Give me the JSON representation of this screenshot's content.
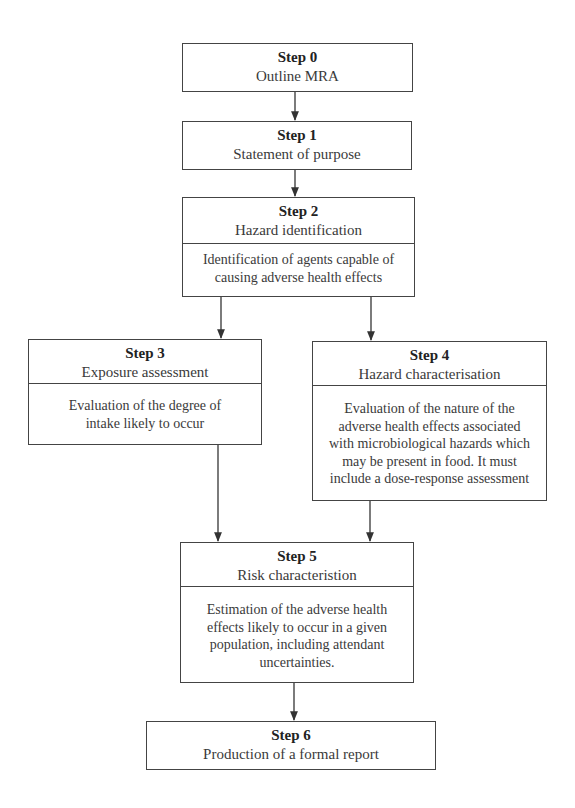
{
  "diagram": {
    "type": "flowchart",
    "steps": [
      {
        "id": "step0",
        "label": "Step 0",
        "title": "Outline MRA",
        "description": ""
      },
      {
        "id": "step1",
        "label": "Step 1",
        "title": "Statement of purpose",
        "description": ""
      },
      {
        "id": "step2",
        "label": "Step 2",
        "title": "Hazard identification",
        "description_lines": [
          "Identification of agents capable of",
          "causing adverse health effects"
        ]
      },
      {
        "id": "step3",
        "label": "Step 3",
        "title": "Exposure assessment",
        "description_lines": [
          "Evaluation of the degree of",
          "intake likely to occur"
        ]
      },
      {
        "id": "step4",
        "label": "Step 4",
        "title": "Hazard characterisation",
        "description_lines": [
          "Evaluation of the nature of the",
          "adverse health effects associated",
          "with microbiological hazards which",
          "may be present in food. It must",
          "include a dose-response assessment"
        ]
      },
      {
        "id": "step5",
        "label": "Step 5",
        "title": "Risk characteristion",
        "description_lines": [
          "Estimation of the adverse health",
          "effects likely to occur in a given",
          "population, including attendant",
          "uncertainties."
        ]
      },
      {
        "id": "step6",
        "label": "Step 6",
        "title": "Production of a formal report",
        "description": ""
      }
    ],
    "edges": [
      {
        "from": "step0",
        "to": "step1"
      },
      {
        "from": "step1",
        "to": "step2"
      },
      {
        "from": "step2",
        "to": "step3"
      },
      {
        "from": "step2",
        "to": "step4"
      },
      {
        "from": "step3",
        "to": "step5"
      },
      {
        "from": "step4",
        "to": "step5"
      },
      {
        "from": "step5",
        "to": "step6"
      }
    ],
    "colors": {
      "line": "#444444",
      "text": "#333333",
      "background": "#ffffff"
    }
  }
}
